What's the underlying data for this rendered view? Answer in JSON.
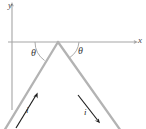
{
  "figure": {
    "background_color": "#ffffff",
    "axes": {
      "x_axis": {
        "label": "x",
        "color": "#9a9a9a",
        "y_position": 42,
        "x_start": 8,
        "x_end": 136
      },
      "y_axis": {
        "label": "y",
        "color": "#9a9a9a",
        "x_position": 12,
        "y_start": 4,
        "y_end": 110
      }
    },
    "wire": {
      "color": "#b3b3b3",
      "stroke_width": 2.2,
      "apex": {
        "x": 58,
        "y": 42
      },
      "left_end": {
        "x": 6,
        "y": 129
      },
      "right_end": {
        "x": 119,
        "y": 129
      }
    },
    "angles": [
      {
        "name": "theta-left",
        "label": "θ",
        "arc_color": "#9a9a9a"
      },
      {
        "name": "theta-right",
        "label": "θ",
        "arc_color": "#9a9a9a"
      }
    ],
    "currents": [
      {
        "name": "current-left",
        "label": "i",
        "direction": "up-right toward apex",
        "color": "#1a1a1a"
      },
      {
        "name": "current-right",
        "label": "i",
        "direction": "down-right away from apex",
        "color": "#1a1a1a"
      }
    ]
  }
}
